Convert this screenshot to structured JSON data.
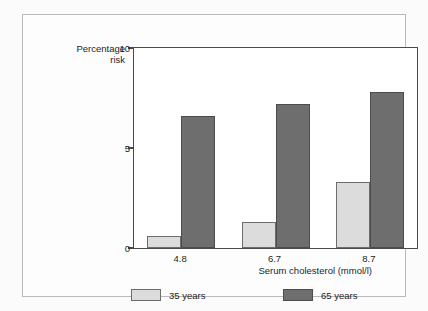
{
  "chart_data": {
    "type": "bar",
    "title": "",
    "xlabel": "Serum cholesterol (mmol/l)",
    "ylabel": "Percentage risk",
    "ylabel_line1": "Percentage",
    "ylabel_line2": "risk",
    "categories": [
      "4.8",
      "6.7",
      "8.7"
    ],
    "series": [
      {
        "name": "35 years",
        "values": [
          0.6,
          1.3,
          3.3
        ],
        "color": "#dcdcdc"
      },
      {
        "name": "65 years",
        "values": [
          6.6,
          7.2,
          7.8
        ],
        "color": "#6e6e6e"
      }
    ],
    "ylim": [
      0,
      10
    ],
    "yticks": [
      "0",
      "5",
      "10"
    ],
    "ytick_values": [
      0,
      5,
      10
    ],
    "grid": false,
    "legend_position": "bottom"
  },
  "axes": {
    "y_title_line1": "Percentage",
    "y_title_line2": "risk",
    "x_title": "Serum cholesterol (mmol/l)"
  },
  "legend": {
    "items": [
      {
        "label": "35 years",
        "swatch": "light"
      },
      {
        "label": "65 years",
        "swatch": "dark"
      }
    ]
  },
  "colors": {
    "light_bar": "#dcdcdc",
    "dark_bar": "#6e6e6e",
    "axis": "#4a4a4a",
    "frame_border": "#b9b9b9",
    "text": "#1d1d1d"
  }
}
